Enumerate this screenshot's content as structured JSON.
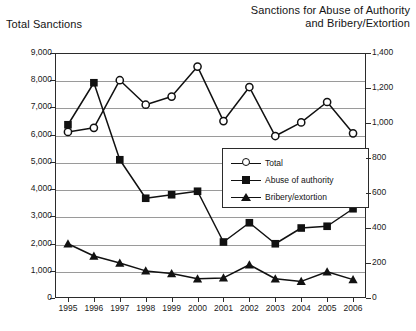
{
  "titles": {
    "left_axis_title": "Total Sanctions",
    "right_axis_title_line1": "Sanctions for Abuse of Authority",
    "right_axis_title_line2": "and Bribery/Extortion"
  },
  "legend": {
    "position": "center-right-inside",
    "items": [
      {
        "label": "Total",
        "marker": "open-circle"
      },
      {
        "label": "Abuse of authority",
        "marker": "filled-square"
      },
      {
        "label": "Bribery/extortion",
        "marker": "filled-triangle"
      }
    ]
  },
  "axes": {
    "left_ticks": [
      "0",
      "1,000",
      "2,000",
      "3,000",
      "4,000",
      "5,000",
      "6,000",
      "7,000",
      "8,000",
      "9,000"
    ],
    "right_ticks": [
      "0",
      "200",
      "400",
      "600",
      "800",
      "1,000",
      "1,200",
      "1,400"
    ],
    "x_ticks": [
      "1995",
      "1996",
      "1997",
      "1998",
      "1999",
      "2000",
      "2001",
      "2002",
      "2003",
      "2004",
      "2005",
      "2006"
    ]
  },
  "chart_data": {
    "type": "line",
    "title": "",
    "xlabel": "",
    "ylabel": "Total Sanctions",
    "y2label": "Sanctions for Abuse of Authority and Bribery/Extortion",
    "grid": true,
    "legend_position": "center-right-inside",
    "categories": [
      "1995",
      "1996",
      "1997",
      "1998",
      "1999",
      "2000",
      "2001",
      "2002",
      "2003",
      "2004",
      "2005",
      "2006"
    ],
    "ylim": [
      0,
      9000
    ],
    "y2lim": [
      0,
      1400
    ],
    "ytick_step": 1000,
    "y2tick_step": 200,
    "series": [
      {
        "name": "Total",
        "marker": "open-circle",
        "axis": "left",
        "values": [
          6100,
          6250,
          8000,
          7100,
          7400,
          8500,
          6500,
          7750,
          5950,
          6450,
          7200,
          6050
        ]
      },
      {
        "name": "Abuse of authority",
        "marker": "filled-square",
        "axis": "right",
        "values": [
          990,
          1230,
          790,
          570,
          590,
          610,
          320,
          430,
          310,
          400,
          410,
          510
        ]
      },
      {
        "name": "Bribery/extortion",
        "marker": "filled-triangle",
        "axis": "right",
        "values": [
          310,
          240,
          200,
          155,
          140,
          110,
          115,
          190,
          110,
          95,
          150,
          105
        ]
      }
    ]
  }
}
